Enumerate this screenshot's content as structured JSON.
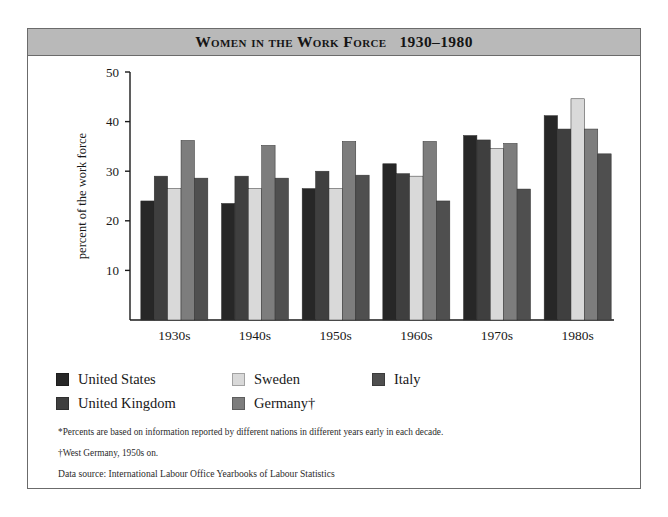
{
  "figure": {
    "title": "Women in the Work Force   1930–1980"
  },
  "legend": {
    "items": [
      {
        "label": "United States",
        "color": "#272727"
      },
      {
        "label": "Sweden",
        "color": "#d9d9d9"
      },
      {
        "label": "Italy",
        "color": "#4f4f4f"
      },
      {
        "label": "United Kingdom",
        "color": "#3f3f3f"
      },
      {
        "label": "Germany†",
        "color": "#7d7d7d"
      }
    ]
  },
  "notes": {
    "footnote_percents": "*Percents are based on information reported by different nations in different years early in each decade.",
    "footnote_germany": "†West Germany, 1950s on.",
    "source": "Data source: International Labour Office Yearbooks of Labour Statistics"
  },
  "chart_data": {
    "type": "bar",
    "title": "Women in the Work Force   1930–1980",
    "xlabel": "decades*",
    "ylabel": "percent of the work force",
    "ylim": [
      0,
      50
    ],
    "yticks": [
      10,
      20,
      30,
      40,
      50
    ],
    "grid": false,
    "legend_position": "below-plot",
    "categories": [
      "1930s",
      "1940s",
      "1950s",
      "1960s",
      "1970s",
      "1980s"
    ],
    "series": [
      {
        "name": "United States",
        "color": "#272727",
        "values": [
          24.0,
          23.5,
          26.5,
          31.5,
          37.2,
          41.2
        ]
      },
      {
        "name": "United Kingdom",
        "color": "#3f3f3f",
        "values": [
          29.0,
          29.0,
          30.0,
          29.5,
          36.3,
          38.5
        ]
      },
      {
        "name": "Sweden",
        "color": "#d9d9d9",
        "values": [
          26.5,
          26.5,
          26.5,
          29.0,
          34.6,
          44.6
        ]
      },
      {
        "name": "Germany†",
        "color": "#7d7d7d",
        "values": [
          36.2,
          35.2,
          36.0,
          36.0,
          35.6,
          38.5
        ]
      },
      {
        "name": "Italy",
        "color": "#4f4f4f",
        "values": [
          28.6,
          28.6,
          29.2,
          24.0,
          26.4,
          33.5
        ]
      }
    ]
  }
}
